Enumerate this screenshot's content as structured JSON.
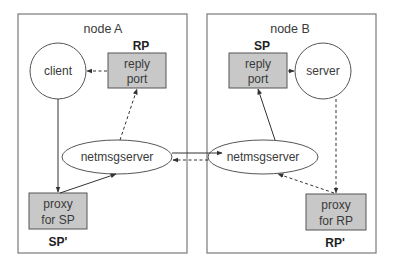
{
  "nodes": {
    "a": {
      "title": "node A",
      "client": "client",
      "reply_port": {
        "line1": "reply",
        "line2": "port",
        "tag": "RP"
      },
      "netmsgserver": "netmsgserver",
      "proxy": {
        "line1": "proxy",
        "line2": "for SP",
        "tag": "SP'"
      }
    },
    "b": {
      "title": "node B",
      "server": "server",
      "reply_port": {
        "line1": "reply",
        "line2": "port",
        "tag": "SP"
      },
      "netmsgserver": "netmsgserver",
      "proxy": {
        "line1": "proxy",
        "line2": "for RP",
        "tag": "RP'"
      }
    }
  },
  "colors": {
    "box_border": "#7a7a7a",
    "port_fill": "#c8c8c8",
    "line": "#333333",
    "text": "#3a3a3a"
  },
  "edges": [
    {
      "from": "reply port (RP)",
      "to": "client",
      "style": "dashed"
    },
    {
      "from": "client",
      "to": "proxy for SP",
      "style": "solid"
    },
    {
      "from": "proxy for SP",
      "to": "netmsgserver A",
      "style": "solid"
    },
    {
      "from": "netmsgserver A",
      "to": "reply port (RP)",
      "style": "dashed"
    },
    {
      "from": "netmsgserver A",
      "to": "netmsgserver B",
      "style": "solid"
    },
    {
      "from": "netmsgserver B",
      "to": "netmsgserver A",
      "style": "dashed"
    },
    {
      "from": "netmsgserver B",
      "to": "reply port (SP)",
      "style": "solid"
    },
    {
      "from": "reply port (SP)",
      "to": "server",
      "style": "solid"
    },
    {
      "from": "server",
      "to": "proxy for RP",
      "style": "dashed"
    },
    {
      "from": "proxy for RP",
      "to": "netmsgserver B",
      "style": "dashed"
    }
  ]
}
